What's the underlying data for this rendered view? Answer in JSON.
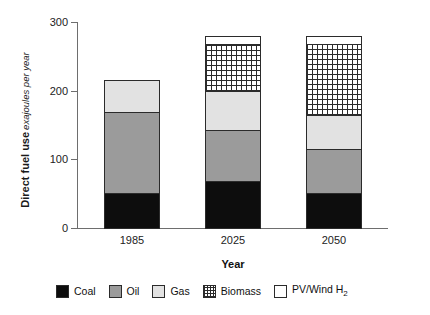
{
  "chart_data": {
    "type": "bar",
    "stacked": true,
    "title": "",
    "xlabel": "Year",
    "ylabel": "Direct fuel use",
    "ylabel_sub": "exajoules per year",
    "categories": [
      "1985",
      "2025",
      "2050"
    ],
    "ylim": [
      0,
      300
    ],
    "yticks": [
      0,
      100,
      200,
      300
    ],
    "ytick_labels": [
      "0",
      "100",
      "200",
      "300"
    ],
    "grid": false,
    "legend_position": "bottom",
    "series": [
      {
        "name": "Coal",
        "values": [
          52,
          70,
          52
        ],
        "color": "#0d0d0d",
        "pattern": "solid"
      },
      {
        "name": "Oil",
        "values": [
          120,
          76,
          66
        ],
        "color": "#9b9b9b",
        "pattern": "solid"
      },
      {
        "name": "Gas",
        "values": [
          48,
          58,
          51
        ],
        "color": "#e2e2e2",
        "pattern": "solid"
      },
      {
        "name": "Biomass",
        "values": [
          0,
          70,
          105
        ],
        "color": "#ffffff",
        "pattern": "grid"
      },
      {
        "name": "PV/Wind H2",
        "values": [
          0,
          13,
          13
        ],
        "color": "#ffffff",
        "pattern": "solid"
      }
    ],
    "totals": [
      220,
      287,
      287
    ]
  },
  "axes": {
    "y_title_main": "Direct fuel use",
    "y_title_sub": "exajoules per year",
    "x_title": "Year",
    "y_ticks": [
      "300",
      "200",
      "100",
      "0"
    ],
    "x_ticks": [
      "1985",
      "2025",
      "2050"
    ]
  },
  "legend": {
    "items": [
      {
        "label": "Coal",
        "html": "Coal"
      },
      {
        "label": "Oil",
        "html": "Oil"
      },
      {
        "label": "Gas",
        "html": "Gas"
      },
      {
        "label": "Biomass",
        "html": "Biomass"
      },
      {
        "label": "PV/Wind H2",
        "html": "PV/Wind H"
      }
    ],
    "pv_subscript": "2"
  },
  "colors": {
    "coal": "#0d0d0d",
    "oil": "#9b9b9b",
    "gas": "#e2e2e2",
    "biomass_line": "#2b2b2b",
    "pv_wind": "#ffffff",
    "axis": "#6e6e6e",
    "outline": "#2b2b2b",
    "background": "#ffffff"
  }
}
